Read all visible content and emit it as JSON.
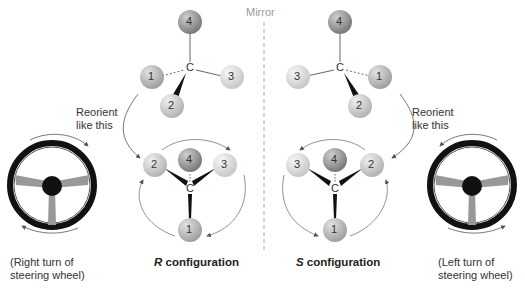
{
  "mirror_label": "Mirror",
  "reorient_label_left": [
    "Reorient",
    "like this"
  ],
  "reorient_label_right": [
    "Reorient",
    "like this"
  ],
  "left_wheel_caption": [
    "(Right turn of",
    "steering wheel)"
  ],
  "right_wheel_caption": [
    "(Left turn of",
    "steering wheel)"
  ],
  "r_config": {
    "letter": "R",
    "text": " configuration"
  },
  "s_config": {
    "letter": "S",
    "text": " configuration"
  },
  "center_atom": "C",
  "colors": {
    "sphere_4": "#8f8f8f",
    "sphere_1": "#b5b5b5",
    "sphere_2": "#c9c9c9",
    "sphere_3": "#dcdcdc",
    "mirror_line": "#aaaaaa",
    "wheel_rim": "#111111"
  },
  "molecules": {
    "top_left": {
      "priorities": [
        "4",
        "1",
        "3",
        "2"
      ]
    },
    "top_right": {
      "priorities": [
        "4",
        "3",
        "1",
        "2"
      ]
    },
    "bottom_left_R": {
      "priorities": [
        "2",
        "4",
        "3",
        "1"
      ]
    },
    "bottom_right_S": {
      "priorities": [
        "3",
        "4",
        "2",
        "1"
      ]
    }
  }
}
